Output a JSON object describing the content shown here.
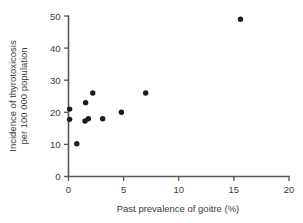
{
  "chart_data": {
    "type": "scatter",
    "title": "",
    "xlabel": "Past prevalence of goitre (%)",
    "ylabel": "Incidence of thyrotoxicosis per 100 000 population",
    "ylabel_line1": "Incidence of thyrotoxicosis",
    "ylabel_line2": "per 100 000 population",
    "xlim": [
      0,
      20
    ],
    "ylim": [
      0,
      50
    ],
    "xticks": [
      0,
      5,
      10,
      15,
      20
    ],
    "yticks": [
      0,
      10,
      20,
      30,
      40,
      50
    ],
    "xtick_labels": [
      "0",
      "5",
      "10",
      "15",
      "20"
    ],
    "ytick_labels": [
      "0",
      "10",
      "20",
      "30",
      "40",
      "50"
    ],
    "grid": false,
    "legend": false,
    "marker": "filled-circle",
    "marker_color": "#1b1b1b",
    "marker_size_px": 4.0,
    "series": [
      {
        "name": "Regions",
        "points": [
          {
            "x": 0.1,
            "y": 21.0
          },
          {
            "x": 0.1,
            "y": 17.8
          },
          {
            "x": 0.75,
            "y": 10.2
          },
          {
            "x": 1.5,
            "y": 17.3
          },
          {
            "x": 1.55,
            "y": 23.0
          },
          {
            "x": 1.8,
            "y": 18.0
          },
          {
            "x": 2.2,
            "y": 26.0
          },
          {
            "x": 3.1,
            "y": 18.0
          },
          {
            "x": 4.8,
            "y": 20.0
          },
          {
            "x": 7.0,
            "y": 26.0
          },
          {
            "x": 15.6,
            "y": 49.0
          }
        ]
      }
    ]
  },
  "axes": {
    "x_axis_name": "x-axis",
    "y_axis_name": "y-axis"
  }
}
